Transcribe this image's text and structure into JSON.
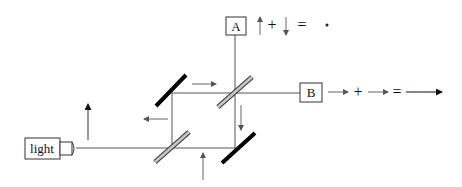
{
  "diagram": {
    "light_source": {
      "label": "light"
    },
    "detectors": [
      {
        "id": "A",
        "label": "A",
        "equation": {
          "plus": "+",
          "equals": "=",
          "result": "destructive (dot)"
        }
      },
      {
        "id": "B",
        "label": "B",
        "equation": {
          "plus": "+",
          "equals": "=",
          "result": "constructive (long arrow)"
        }
      }
    ],
    "components": {
      "mirrors": [
        "upper-left mirror",
        "lower-right mirror"
      ],
      "beam_splitters": [
        "lower-left beam splitter",
        "upper-right beam splitter"
      ]
    },
    "colors": {
      "line": "#555555",
      "mirror": "#000000",
      "beam_splitter_fill": "#bbbbbb",
      "arrow": "#666666",
      "text": "#111111"
    }
  }
}
